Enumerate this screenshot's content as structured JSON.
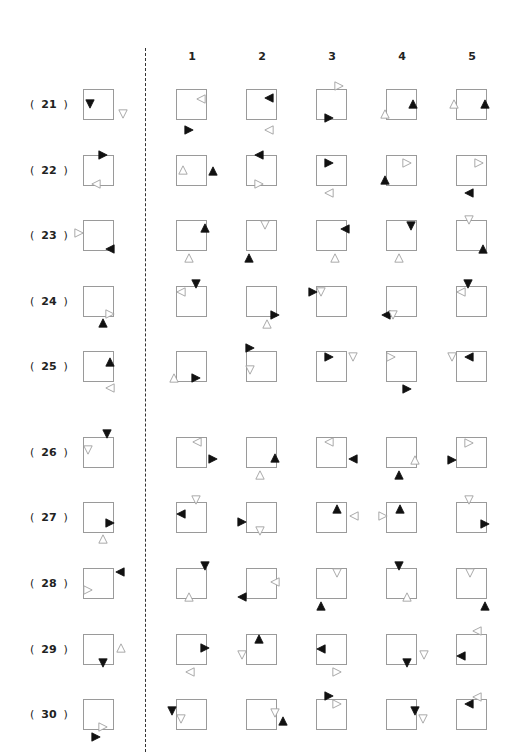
{
  "columns": [
    "1",
    "2",
    "3",
    "4",
    "5"
  ],
  "colors": {
    "box_border": "#9a9a9a",
    "filled": "#111111",
    "outline": "#999999"
  },
  "rows": [
    {
      "label": "21",
      "y": 89,
      "question": [
        {
          "dx": 2,
          "dy": 10,
          "dir": "down",
          "fill": true
        },
        {
          "dx": 35,
          "dy": 20,
          "dir": "down",
          "fill": false
        }
      ],
      "options": [
        [
          {
            "dx": 20,
            "dy": 5,
            "dir": "left",
            "fill": false
          },
          {
            "dx": 8,
            "dy": 36,
            "dir": "right",
            "fill": true
          }
        ],
        [
          {
            "dx": 18,
            "dy": 4,
            "dir": "left",
            "fill": true
          },
          {
            "dx": 18,
            "dy": 36,
            "dir": "left",
            "fill": false
          }
        ],
        [
          {
            "dx": 18,
            "dy": -8,
            "dir": "right",
            "fill": false
          },
          {
            "dx": 8,
            "dy": 24,
            "dir": "right",
            "fill": true
          }
        ],
        [
          {
            "dx": -6,
            "dy": 20,
            "dir": "up",
            "fill": false
          },
          {
            "dx": 22,
            "dy": 10,
            "dir": "up",
            "fill": true
          }
        ],
        [
          {
            "dx": -7,
            "dy": 10,
            "dir": "up",
            "fill": false
          },
          {
            "dx": 24,
            "dy": 10,
            "dir": "up",
            "fill": true
          }
        ]
      ]
    },
    {
      "label": "22",
      "y": 155,
      "question": [
        {
          "dx": 15,
          "dy": -5,
          "dir": "right",
          "fill": true
        },
        {
          "dx": 8,
          "dy": 24,
          "dir": "left",
          "fill": false
        }
      ],
      "options": [
        [
          {
            "dx": 2,
            "dy": 10,
            "dir": "up",
            "fill": false
          },
          {
            "dx": 32,
            "dy": 11,
            "dir": "up",
            "fill": true
          }
        ],
        [
          {
            "dx": 8,
            "dy": -5,
            "dir": "left",
            "fill": true
          },
          {
            "dx": 8,
            "dy": 24,
            "dir": "right",
            "fill": false
          }
        ],
        [
          {
            "dx": 8,
            "dy": 3,
            "dir": "right",
            "fill": true
          },
          {
            "dx": 8,
            "dy": 33,
            "dir": "left",
            "fill": false
          }
        ],
        [
          {
            "dx": 16,
            "dy": 3,
            "dir": "right",
            "fill": false
          },
          {
            "dx": -6,
            "dy": 20,
            "dir": "up",
            "fill": true
          }
        ],
        [
          {
            "dx": 18,
            "dy": 3,
            "dir": "right",
            "fill": false
          },
          {
            "dx": 8,
            "dy": 33,
            "dir": "left",
            "fill": true
          }
        ]
      ]
    },
    {
      "label": "23",
      "y": 220,
      "question": [
        {
          "dx": -9,
          "dy": 8,
          "dir": "right",
          "fill": false
        },
        {
          "dx": 22,
          "dy": 24,
          "dir": "left",
          "fill": true
        }
      ],
      "options": [
        [
          {
            "dx": 24,
            "dy": 3,
            "dir": "up",
            "fill": true
          },
          {
            "dx": 8,
            "dy": 33,
            "dir": "up",
            "fill": false
          }
        ],
        [
          {
            "dx": 14,
            "dy": 0,
            "dir": "down",
            "fill": false
          },
          {
            "dx": -2,
            "dy": 33,
            "dir": "up",
            "fill": true
          }
        ],
        [
          {
            "dx": 24,
            "dy": 4,
            "dir": "left",
            "fill": true
          },
          {
            "dx": 14,
            "dy": 33,
            "dir": "up",
            "fill": false
          }
        ],
        [
          {
            "dx": 20,
            "dy": 1,
            "dir": "down",
            "fill": true
          },
          {
            "dx": 8,
            "dy": 33,
            "dir": "up",
            "fill": false
          }
        ],
        [
          {
            "dx": 8,
            "dy": -5,
            "dir": "down",
            "fill": false
          },
          {
            "dx": 22,
            "dy": 24,
            "dir": "up",
            "fill": true
          }
        ]
      ]
    },
    {
      "label": "24",
      "y": 286,
      "question": [
        {
          "dx": 22,
          "dy": 23,
          "dir": "right",
          "fill": false
        },
        {
          "dx": 15,
          "dy": 32,
          "dir": "up",
          "fill": true
        }
      ],
      "options": [
        [
          {
            "dx": 0,
            "dy": 1,
            "dir": "left",
            "fill": false
          },
          {
            "dx": 15,
            "dy": -7,
            "dir": "down",
            "fill": true
          }
        ],
        [
          {
            "dx": 24,
            "dy": 24,
            "dir": "right",
            "fill": true
          },
          {
            "dx": 16,
            "dy": 33,
            "dir": "up",
            "fill": false
          }
        ],
        [
          {
            "dx": -8,
            "dy": 1,
            "dir": "right",
            "fill": true
          },
          {
            "dx": 0,
            "dy": 1,
            "dir": "down",
            "fill": false
          }
        ],
        [
          {
            "dx": -5,
            "dy": 24,
            "dir": "left",
            "fill": true
          },
          {
            "dx": 2,
            "dy": 24,
            "dir": "down",
            "fill": false
          }
        ],
        [
          {
            "dx": 0,
            "dy": 1,
            "dir": "left",
            "fill": false
          },
          {
            "dx": 7,
            "dy": -7,
            "dir": "down",
            "fill": true
          }
        ]
      ]
    },
    {
      "label": "25",
      "y": 351,
      "question": [
        {
          "dx": 22,
          "dy": 6,
          "dir": "up",
          "fill": true
        },
        {
          "dx": 22,
          "dy": 32,
          "dir": "left",
          "fill": false
        }
      ],
      "options": [
        [
          {
            "dx": -7,
            "dy": 22,
            "dir": "up",
            "fill": false
          },
          {
            "dx": 15,
            "dy": 22,
            "dir": "right",
            "fill": true
          }
        ],
        [
          {
            "dx": -1,
            "dy": -8,
            "dir": "right",
            "fill": true
          },
          {
            "dx": -1,
            "dy": 14,
            "dir": "down",
            "fill": false
          }
        ],
        [
          {
            "dx": 8,
            "dy": 1,
            "dir": "right",
            "fill": true
          },
          {
            "dx": 32,
            "dy": 1,
            "dir": "down",
            "fill": false
          }
        ],
        [
          {
            "dx": 0,
            "dy": 1,
            "dir": "right",
            "fill": false
          },
          {
            "dx": 16,
            "dy": 33,
            "dir": "right",
            "fill": true
          }
        ],
        [
          {
            "dx": -9,
            "dy": 1,
            "dir": "down",
            "fill": false
          },
          {
            "dx": 8,
            "dy": 1,
            "dir": "left",
            "fill": true
          }
        ]
      ]
    },
    {
      "label": "26",
      "y": 437,
      "question": [
        {
          "dx": 19,
          "dy": -8,
          "dir": "down",
          "fill": true
        },
        {
          "dx": 0,
          "dy": 8,
          "dir": "down",
          "fill": false
        }
      ],
      "options": [
        [
          {
            "dx": 16,
            "dy": 0,
            "dir": "left",
            "fill": false
          },
          {
            "dx": 32,
            "dy": 17,
            "dir": "right",
            "fill": true
          }
        ],
        [
          {
            "dx": 24,
            "dy": 16,
            "dir": "up",
            "fill": true
          },
          {
            "dx": 9,
            "dy": 33,
            "dir": "up",
            "fill": false
          }
        ],
        [
          {
            "dx": 8,
            "dy": 0,
            "dir": "left",
            "fill": false
          },
          {
            "dx": 32,
            "dy": 17,
            "dir": "left",
            "fill": true
          }
        ],
        [
          {
            "dx": 24,
            "dy": 18,
            "dir": "up",
            "fill": false
          },
          {
            "dx": 8,
            "dy": 33,
            "dir": "up",
            "fill": true
          }
        ],
        [
          {
            "dx": 8,
            "dy": 1,
            "dir": "right",
            "fill": false
          },
          {
            "dx": -9,
            "dy": 18,
            "dir": "right",
            "fill": true
          }
        ]
      ]
    },
    {
      "label": "27",
      "y": 502,
      "question": [
        {
          "dx": 22,
          "dy": 16,
          "dir": "right",
          "fill": true
        },
        {
          "dx": 15,
          "dy": 32,
          "dir": "up",
          "fill": false
        }
      ],
      "options": [
        [
          {
            "dx": 15,
            "dy": -7,
            "dir": "down",
            "fill": false
          },
          {
            "dx": 0,
            "dy": 7,
            "dir": "left",
            "fill": true
          }
        ],
        [
          {
            "dx": -9,
            "dy": 15,
            "dir": "right",
            "fill": true
          },
          {
            "dx": 9,
            "dy": 24,
            "dir": "down",
            "fill": false
          }
        ],
        [
          {
            "dx": 16,
            "dy": 2,
            "dir": "up",
            "fill": true
          },
          {
            "dx": 33,
            "dy": 9,
            "dir": "left",
            "fill": false
          }
        ],
        [
          {
            "dx": -8,
            "dy": 9,
            "dir": "right",
            "fill": false
          },
          {
            "dx": 9,
            "dy": 2,
            "dir": "up",
            "fill": true
          }
        ],
        [
          {
            "dx": 8,
            "dy": -7,
            "dir": "down",
            "fill": false
          },
          {
            "dx": 24,
            "dy": 17,
            "dir": "right",
            "fill": true
          }
        ]
      ]
    },
    {
      "label": "28",
      "y": 568,
      "question": [
        {
          "dx": 32,
          "dy": -1,
          "dir": "left",
          "fill": true
        },
        {
          "dx": 0,
          "dy": 17,
          "dir": "right",
          "fill": false
        }
      ],
      "options": [
        [
          {
            "dx": 24,
            "dy": -7,
            "dir": "down",
            "fill": true
          },
          {
            "dx": 8,
            "dy": 24,
            "dir": "up",
            "fill": false
          }
        ],
        [
          {
            "dx": -9,
            "dy": 24,
            "dir": "left",
            "fill": true
          },
          {
            "dx": 24,
            "dy": 9,
            "dir": "left",
            "fill": false
          }
        ],
        [
          {
            "dx": 16,
            "dy": 0,
            "dir": "down",
            "fill": false
          },
          {
            "dx": 0,
            "dy": 33,
            "dir": "up",
            "fill": true
          }
        ],
        [
          {
            "dx": 8,
            "dy": -7,
            "dir": "down",
            "fill": true
          },
          {
            "dx": 16,
            "dy": 24,
            "dir": "up",
            "fill": false
          }
        ],
        [
          {
            "dx": 9,
            "dy": 0,
            "dir": "down",
            "fill": false
          },
          {
            "dx": 24,
            "dy": 33,
            "dir": "up",
            "fill": true
          }
        ]
      ]
    },
    {
      "label": "29",
      "y": 634,
      "question": [
        {
          "dx": 15,
          "dy": 24,
          "dir": "down",
          "fill": true
        },
        {
          "dx": 33,
          "dy": 9,
          "dir": "up",
          "fill": false
        }
      ],
      "options": [
        [
          {
            "dx": 24,
            "dy": 9,
            "dir": "right",
            "fill": true
          },
          {
            "dx": 9,
            "dy": 33,
            "dir": "left",
            "fill": false
          }
        ],
        [
          {
            "dx": 8,
            "dy": 0,
            "dir": "up",
            "fill": true
          },
          {
            "dx": -9,
            "dy": 16,
            "dir": "down",
            "fill": false
          }
        ],
        [
          {
            "dx": 0,
            "dy": 10,
            "dir": "left",
            "fill": true
          },
          {
            "dx": 16,
            "dy": 33,
            "dir": "right",
            "fill": false
          }
        ],
        [
          {
            "dx": 16,
            "dy": 24,
            "dir": "down",
            "fill": true
          },
          {
            "dx": 33,
            "dy": 16,
            "dir": "down",
            "fill": false
          }
        ],
        [
          {
            "dx": 16,
            "dy": -8,
            "dir": "left",
            "fill": false
          },
          {
            "dx": 0,
            "dy": 17,
            "dir": "left",
            "fill": true
          }
        ]
      ]
    },
    {
      "label": "30",
      "y": 699,
      "question": [
        {
          "dx": 15,
          "dy": 23,
          "dir": "right",
          "fill": false
        },
        {
          "dx": 8,
          "dy": 33,
          "dir": "right",
          "fill": true
        }
      ],
      "options": [
        [
          {
            "dx": -9,
            "dy": 7,
            "dir": "down",
            "fill": true
          },
          {
            "dx": 0,
            "dy": 15,
            "dir": "down",
            "fill": false
          }
        ],
        [
          {
            "dx": 24,
            "dy": 9,
            "dir": "down",
            "fill": false
          },
          {
            "dx": 32,
            "dy": 17,
            "dir": "up",
            "fill": true
          }
        ],
        [
          {
            "dx": 8,
            "dy": -8,
            "dir": "right",
            "fill": true
          },
          {
            "dx": 16,
            "dy": 0,
            "dir": "right",
            "fill": false
          }
        ],
        [
          {
            "dx": 24,
            "dy": 7,
            "dir": "down",
            "fill": true
          },
          {
            "dx": 32,
            "dy": 15,
            "dir": "down",
            "fill": false
          }
        ],
        [
          {
            "dx": 16,
            "dy": -7,
            "dir": "left",
            "fill": false
          },
          {
            "dx": 8,
            "dy": 0,
            "dir": "left",
            "fill": true
          }
        ]
      ]
    }
  ]
}
